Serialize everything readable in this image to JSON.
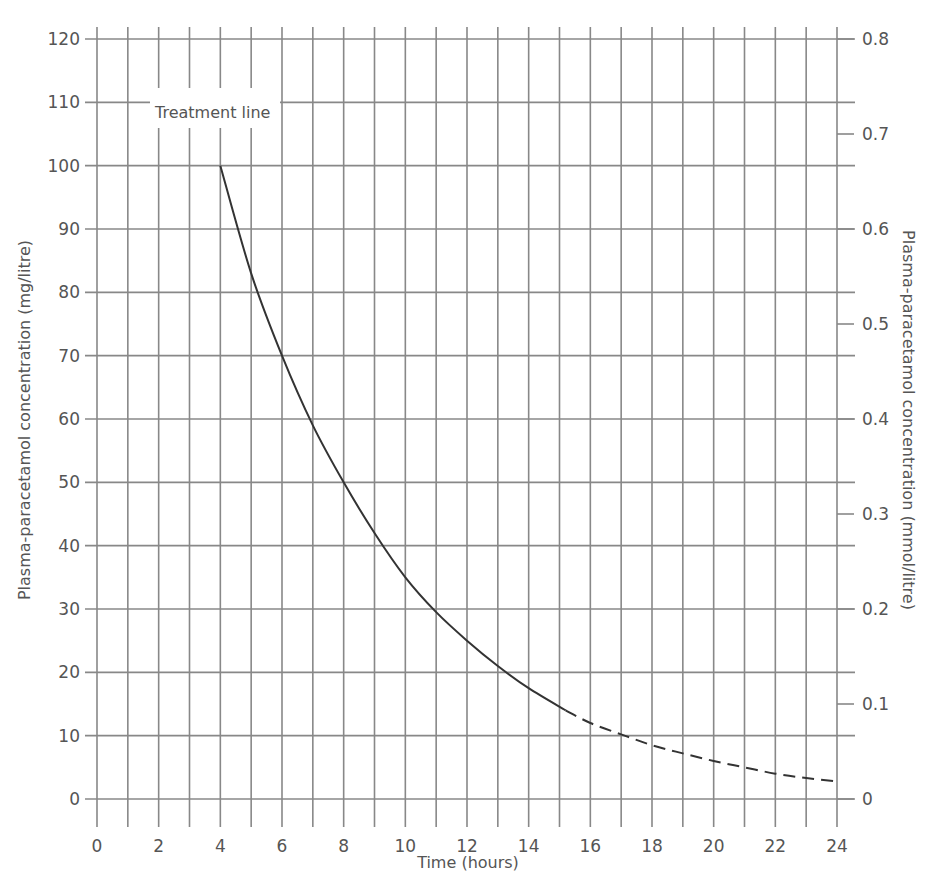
{
  "chart_data": {
    "type": "line",
    "title": "",
    "xlabel": "Time (hours)",
    "ylabel": "Plasma-paracetamol concentration (mg/litre)",
    "ylabel_right": "Plasma-paracetamol concentration (mmol/litre)",
    "xlim": [
      0,
      24
    ],
    "ylim": [
      0,
      120
    ],
    "ylim_right": [
      0,
      0.8
    ],
    "grid": true,
    "x_ticks": [
      "0",
      "2",
      "4",
      "6",
      "8",
      "10",
      "12",
      "14",
      "16",
      "18",
      "20",
      "22",
      "24"
    ],
    "y_ticks": [
      "0",
      "10",
      "20",
      "30",
      "40",
      "50",
      "60",
      "70",
      "80",
      "90",
      "100",
      "110",
      "120"
    ],
    "y_ticks_right": [
      "0",
      "0.1",
      "0.2",
      "0.3",
      "0.4",
      "0.5",
      "0.6",
      "0.7",
      "0.8"
    ],
    "annotations": [
      {
        "text": "Treatment line",
        "x": 4,
        "y": 105
      }
    ],
    "series": [
      {
        "name": "Treatment line (solid)",
        "style": "solid",
        "x": [
          4,
          5,
          6,
          7,
          8,
          9,
          10,
          11,
          12,
          13,
          14,
          15.2
        ],
        "y": [
          100,
          83,
          70,
          59,
          50,
          42,
          35,
          29.5,
          25,
          21,
          17.5,
          14
        ]
      },
      {
        "name": "Treatment line (extrapolated)",
        "style": "dashed",
        "x": [
          15.2,
          16,
          17,
          18,
          19,
          20,
          21,
          22,
          23,
          24
        ],
        "y": [
          14,
          12,
          10.2,
          8.5,
          7.2,
          6,
          5,
          4,
          3.3,
          2.8
        ]
      }
    ]
  }
}
